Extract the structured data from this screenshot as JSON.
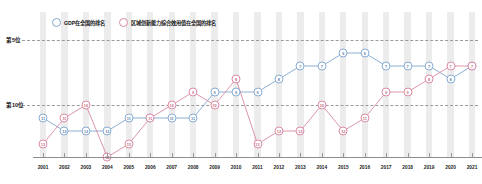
{
  "legend": {
    "position": "top-left",
    "items": [
      {
        "label": "GDP在全国的排名",
        "color": "#7fa6cf",
        "marker": "circle-ring-blue"
      },
      {
        "label": "区域创新能力综合效用值在全国的排名",
        "color": "#d98aa3",
        "marker": "circle-ring-pink"
      }
    ]
  },
  "axis": {
    "y_labels": [
      "第5位",
      "第10位"
    ],
    "y_label_top": "第5位",
    "y_label_bottom": "第10位"
  },
  "chart_data": {
    "type": "line",
    "title": "",
    "subtitle": "",
    "xlabel": "",
    "ylabel": "",
    "grid": true,
    "legend_position": "top-left",
    "y_inverted": true,
    "ylim": [
      14,
      5
    ],
    "y_gridlines": [
      5,
      10
    ],
    "y_gridline_labels": [
      "第5位",
      "第10位"
    ],
    "categories": [
      "2001",
      "2002",
      "2003",
      "2004",
      "2005",
      "2006",
      "2007",
      "2008",
      "2009",
      "2010",
      "2011",
      "2012",
      "2013",
      "2014",
      "2015",
      "2016",
      "2017",
      "2018",
      "2019",
      "2020",
      "2021"
    ],
    "x": [
      "2001",
      "2002",
      "2003",
      "2004",
      "2005",
      "2006",
      "2007",
      "2008",
      "2009",
      "2010",
      "2011",
      "2012",
      "2013",
      "2014",
      "2015",
      "2016",
      "2017",
      "2018",
      "2019",
      "2020",
      "2021"
    ],
    "series": [
      {
        "name": "GDP在全国的排名",
        "color": "#7fa6cf",
        "values": [
          11,
          12,
          12,
          12,
          11,
          11,
          11,
          11,
          9,
          9,
          9,
          8,
          7,
          7,
          6,
          6,
          7,
          7,
          7,
          8,
          7
        ]
      },
      {
        "name": "区域创新能力综合效用值在全国的排名",
        "color": "#d98aa3",
        "values": [
          13,
          11,
          10,
          14,
          13,
          11,
          10,
          9,
          10,
          8,
          13,
          12,
          12,
          10,
          12,
          11,
          9,
          9,
          8,
          7,
          7
        ]
      }
    ]
  }
}
